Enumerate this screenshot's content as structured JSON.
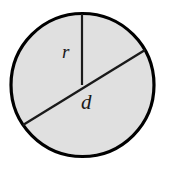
{
  "figure": {
    "kind": "geometry-diagram",
    "width": 169,
    "height": 171,
    "background_color": "#ffffff"
  },
  "circle": {
    "center_x": 82.5,
    "center_y": 85,
    "radius": 71.5,
    "fill_color": "#e0e0e0",
    "stroke_color": "#000000",
    "stroke_width": 3.2
  },
  "radius_segment": {
    "label": "r",
    "x1": 82,
    "y1": 14,
    "x2": 82,
    "y2": 85,
    "stroke_color": "#1a1a1a",
    "stroke_width": 2.2,
    "label_x": 62,
    "label_y": 42,
    "label_font_size": 19
  },
  "diameter_segment": {
    "label": "d",
    "x1": 23,
    "y1": 125,
    "x2": 145,
    "y2": 50,
    "stroke_color": "#1a1a1a",
    "stroke_width": 2.4,
    "label_x": 81,
    "label_y": 92,
    "label_font_size": 21
  }
}
